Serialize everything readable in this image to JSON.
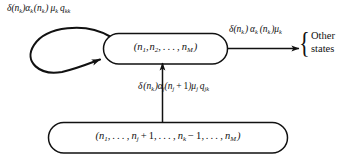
{
  "diagram": {
    "type": "state-transition-diagram",
    "background_color": "#ffffff",
    "stroke_color": "#111111",
    "states": [
      {
        "id": "top-state",
        "label": "(n1, n2, . . . , nM)",
        "label_parts": [
          "(",
          "n",
          "1",
          ", ",
          "n",
          "2",
          ", . . . , ",
          "n",
          "M",
          ")"
        ],
        "shape": "stadium"
      },
      {
        "id": "bottom-state",
        "label": "(n1, . . . , nj + 1, . . . , nk − 1, . . . , nM)",
        "shape": "stadium"
      }
    ],
    "transitions": [
      {
        "id": "self-loop",
        "from": "top-state",
        "to": "top-state",
        "rate_label": "δ(nk)αk(nk) μk qkk",
        "shape": "teardrop-self-loop",
        "direction": "left"
      },
      {
        "id": "exit-transition",
        "from": "top-state",
        "to": "other-states",
        "rate_label": "δ(nk) αk (nk)μk",
        "shape": "straight-arrow",
        "direction": "right"
      },
      {
        "id": "arrival-transition",
        "from": "bottom-state",
        "to": "top-state",
        "rate_label": "δ(nk)αj(nj + 1)μj qjk",
        "shape": "straight-arrow",
        "direction": "up"
      }
    ],
    "other_states": {
      "line1": "Other",
      "line2": "states",
      "brace": "{"
    }
  }
}
